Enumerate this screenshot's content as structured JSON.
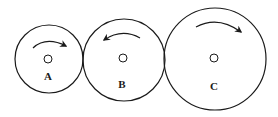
{
  "diagram": {
    "title": "",
    "colors": {
      "stroke": "#1a1a1a",
      "background": "#ffffff"
    },
    "wheels": [
      {
        "label": "A",
        "direction": "clockwise",
        "cx": 49,
        "cy": 59,
        "r": 34
      },
      {
        "label": "B",
        "direction": "counterclockwise",
        "cx": 124,
        "cy": 60,
        "r": 41
      },
      {
        "label": "C",
        "direction": "clockwise",
        "cx": 215,
        "cy": 59,
        "r": 51
      }
    ]
  }
}
